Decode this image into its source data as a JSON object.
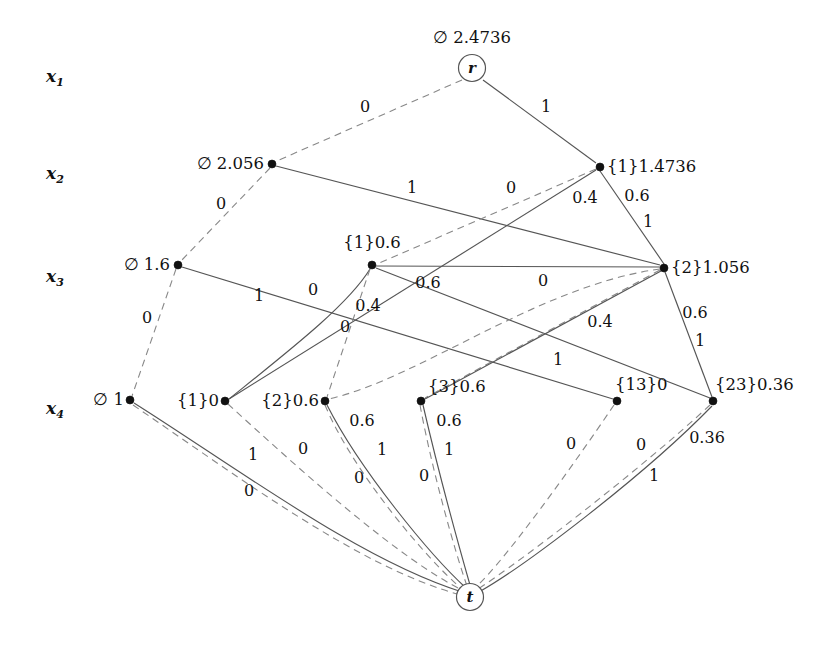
{
  "figure": {
    "background_color": "#ffffff",
    "solid_edge_color": "#555555",
    "dashed_edge_color": "#888888",
    "node_color": "#111111"
  },
  "row_labels": [
    {
      "name": "x1",
      "base": "x",
      "sub": "1",
      "x": 46,
      "y": 68
    },
    {
      "name": "x2",
      "base": "x",
      "sub": "2",
      "x": 46,
      "y": 165
    },
    {
      "name": "x3",
      "base": "x",
      "sub": "3",
      "x": 46,
      "y": 268
    },
    {
      "name": "x4",
      "base": "x",
      "sub": "4",
      "x": 46,
      "y": 400
    }
  ],
  "nodes": [
    {
      "id": "r",
      "label": "r",
      "value_label": "∅ 2.4736",
      "layer": "x1",
      "x": 472,
      "y": 68,
      "shape": "circle",
      "label_pos": "above",
      "label_dx": 0,
      "label_dy": -22
    },
    {
      "id": "n20",
      "label": "",
      "value_label": "∅ 2.056",
      "layer": "x2",
      "x": 272,
      "y": 164,
      "shape": "dot",
      "label_pos": "left",
      "label_dx": -8,
      "label_dy": 0
    },
    {
      "id": "n21",
      "label": "",
      "value_label": "{1}1.4736",
      "layer": "x2",
      "x": 600,
      "y": 167,
      "shape": "dot",
      "label_pos": "right",
      "label_dx": 7,
      "label_dy": 0
    },
    {
      "id": "n30",
      "label": "",
      "value_label": "∅ 1.6",
      "layer": "x3",
      "x": 178,
      "y": 265,
      "shape": "dot",
      "label_pos": "left",
      "label_dx": -8,
      "label_dy": 0
    },
    {
      "id": "n31",
      "label": "",
      "value_label": "{1}0.6",
      "layer": "x3",
      "x": 372,
      "y": 265,
      "shape": "dot",
      "label_pos": "above",
      "label_dx": 0,
      "label_dy": -14
    },
    {
      "id": "n32",
      "label": "",
      "value_label": "{2}1.056",
      "layer": "x3",
      "x": 664,
      "y": 268,
      "shape": "dot",
      "label_pos": "right",
      "label_dx": 7,
      "label_dy": 0
    },
    {
      "id": "n40",
      "label": "",
      "value_label": "∅ 1",
      "layer": "x4",
      "x": 130,
      "y": 400,
      "shape": "dot",
      "label_pos": "left",
      "label_dx": -6,
      "label_dy": 0
    },
    {
      "id": "n41",
      "label": "",
      "value_label": "{1}0",
      "layer": "x4",
      "x": 225,
      "y": 401,
      "shape": "dot",
      "label_pos": "left",
      "label_dx": -6,
      "label_dy": 0
    },
    {
      "id": "n42",
      "label": "",
      "value_label": "{2}0.6",
      "layer": "x4",
      "x": 325,
      "y": 401,
      "shape": "dot",
      "label_pos": "left",
      "label_dx": -6,
      "label_dy": 0
    },
    {
      "id": "n43",
      "label": "",
      "value_label": "{3}0.6",
      "layer": "x4",
      "x": 421,
      "y": 401,
      "shape": "dot",
      "label_pos": "right",
      "label_dx": 7,
      "label_dy": -14
    },
    {
      "id": "n44",
      "label": "",
      "value_label": "{13}0",
      "layer": "x4",
      "x": 617,
      "y": 401,
      "shape": "dot",
      "label_pos": "right",
      "label_dx": -2,
      "label_dy": -16
    },
    {
      "id": "n45",
      "label": "",
      "value_label": "{23}0.36",
      "layer": "x4",
      "x": 713,
      "y": 401,
      "shape": "dot",
      "label_pos": "right",
      "label_dx": 2,
      "label_dy": -16
    },
    {
      "id": "t",
      "label": "t",
      "value_label": "",
      "layer": "t",
      "x": 470,
      "y": 597,
      "shape": "circle",
      "label_pos": "above",
      "label_dx": 0,
      "label_dy": 0
    }
  ],
  "edges": [
    {
      "from": "r",
      "to": "n20",
      "style": "dashed",
      "label": "0",
      "lx": 365,
      "ly": 107
    },
    {
      "from": "r",
      "to": "n21",
      "style": "solid",
      "label": "1",
      "lx": 546,
      "ly": 107
    },
    {
      "from": "n20",
      "to": "n30",
      "style": "dashed",
      "label": "0",
      "lx": 221,
      "ly": 204
    },
    {
      "from": "n20",
      "to": "n32",
      "style": "solid",
      "label": "1",
      "lx": 412,
      "ly": 188
    },
    {
      "from": "n21",
      "to": "n31",
      "style": "dashed",
      "label": "0",
      "lx": 511,
      "ly": 188
    },
    {
      "from": "n21",
      "to": "n41",
      "style": "solid",
      "label": "0.4",
      "lx": 585,
      "ly": 198
    },
    {
      "from": "n21",
      "to": "n32",
      "style": "solid",
      "label": "0.6",
      "lx": 637,
      "ly": 196
    },
    {
      "from": "n21",
      "to": "n32",
      "style": "solid",
      "label": "1",
      "lx": 648,
      "ly": 222
    },
    {
      "from": "n30",
      "to": "n40",
      "style": "dashed",
      "label": "0",
      "lx": 147,
      "ly": 318
    },
    {
      "from": "n30",
      "to": "n44",
      "style": "solid",
      "label": "1",
      "lx": 259,
      "ly": 296
    },
    {
      "from": "n31",
      "to": "n41",
      "style": "solid",
      "label": "0.4",
      "lx": 368,
      "ly": 306
    },
    {
      "from": "n31",
      "to": "n42",
      "style": "dashed",
      "label": "0",
      "lx": 345,
      "ly": 327
    },
    {
      "from": "n31",
      "to": "n32",
      "style": "solid",
      "label": "0.6",
      "lx": 428,
      "ly": 283
    },
    {
      "from": "n31",
      "to": "n45",
      "style": "solid",
      "label": "1",
      "lx": 558,
      "ly": 360
    },
    {
      "from": "n32",
      "to": "n42",
      "style": "dashed",
      "label": "0",
      "lx": 313,
      "ly": 290
    },
    {
      "from": "n32",
      "to": "n43",
      "style": "dashed",
      "label": "0",
      "lx": 543,
      "ly": 281
    },
    {
      "from": "n32",
      "to": "n43",
      "style": "solid",
      "label": "0.4",
      "lx": 600,
      "ly": 322
    },
    {
      "from": "n32",
      "to": "n45",
      "style": "solid",
      "label": "0.6",
      "lx": 695,
      "ly": 313
    },
    {
      "from": "n32",
      "to": "n45",
      "style": "solid",
      "label": "1",
      "lx": 700,
      "ly": 341
    },
    {
      "from": "n40",
      "to": "t",
      "style": "solid",
      "label": "1",
      "lx": 253,
      "ly": 455
    },
    {
      "from": "n40",
      "to": "t",
      "style": "dashed",
      "label": "0",
      "lx": 249,
      "ly": 491
    },
    {
      "from": "n41",
      "to": "t",
      "style": "dashed",
      "label": "0",
      "lx": 303,
      "ly": 449
    },
    {
      "from": "n42",
      "to": "t",
      "style": "solid",
      "label": "0.6",
      "lx": 362,
      "ly": 421
    },
    {
      "from": "n42",
      "to": "t",
      "style": "solid",
      "label": "1",
      "lx": 382,
      "ly": 450
    },
    {
      "from": "n42",
      "to": "t",
      "style": "dashed",
      "label": "0",
      "lx": 359,
      "ly": 478
    },
    {
      "from": "n43",
      "to": "t",
      "style": "solid",
      "label": "0.6",
      "lx": 449,
      "ly": 421
    },
    {
      "from": "n43",
      "to": "t",
      "style": "solid",
      "label": "1",
      "lx": 449,
      "ly": 450
    },
    {
      "from": "n43",
      "to": "t",
      "style": "dashed",
      "label": "0",
      "lx": 424,
      "ly": 476
    },
    {
      "from": "n44",
      "to": "t",
      "style": "dashed",
      "label": "0",
      "lx": 571,
      "ly": 444
    },
    {
      "from": "n45",
      "to": "t",
      "style": "dashed",
      "label": "0",
      "lx": 641,
      "ly": 445
    },
    {
      "from": "n45",
      "to": "t",
      "style": "solid",
      "label": "0.36",
      "lx": 707,
      "ly": 438
    },
    {
      "from": "n45",
      "to": "t",
      "style": "solid",
      "label": "1",
      "lx": 654,
      "ly": 476
    }
  ],
  "edge_paths": [
    {
      "name": "r-to-n20",
      "style": "dashed",
      "d": "M 462 80 L 279 160"
    },
    {
      "name": "r-to-n21",
      "style": "solid",
      "d": "M 483 80 L 596 163"
    },
    {
      "name": "n20-to-n30",
      "style": "dashed",
      "d": "M 270 168 L 181 261"
    },
    {
      "name": "n20-to-n32",
      "style": "solid",
      "d": "M 276 166 L 660 265"
    },
    {
      "name": "n21-to-n31",
      "style": "dashed",
      "d": "M 596 169 L 377 264"
    },
    {
      "name": "n21-to-n41",
      "style": "solid",
      "d": "M 596 170 L 229 399"
    },
    {
      "name": "n21-to-n32",
      "style": "solid",
      "d": "M 600 171 L 664 264"
    },
    {
      "name": "n30-to-n40",
      "style": "dashed",
      "d": "M 176 269 L 132 396"
    },
    {
      "name": "n30-to-n44",
      "style": "solid",
      "d": "M 182 267 L 613 399"
    },
    {
      "name": "n31-curve-n41",
      "style": "solid",
      "d": "M 370 269 C 348 305 290 350 229 399"
    },
    {
      "name": "n31-to-n42",
      "style": "dashed",
      "d": "M 370 269 L 327 397"
    },
    {
      "name": "n31-to-n32",
      "style": "solid",
      "d": "M 376 266 L 660 267"
    },
    {
      "name": "n31-to-n45",
      "style": "solid",
      "d": "M 376 268 L 710 398"
    },
    {
      "name": "n32-to-n42",
      "style": "dashed",
      "d": "M 660 269 C 540 285 420 378 329 399"
    },
    {
      "name": "n32-to-n43",
      "style": "dashed",
      "d": "M 660 270 L 425 398"
    },
    {
      "name": "n32-to-n43",
      "style": "solid",
      "d": "M 661 271 L 425 399"
    },
    {
      "name": "n32-to-n45",
      "style": "solid",
      "d": "M 665 272 L 712 397"
    },
    {
      "name": "n40-to-t",
      "style": "solid",
      "d": "M 134 403 C 240 470 360 560 462 592"
    },
    {
      "name": "n40-to-t",
      "style": "dashed",
      "d": "M 133 405 C 240 478 360 568 461 595"
    },
    {
      "name": "n41-to-t",
      "style": "dashed",
      "d": "M 228 404 C 300 470 400 560 464 591"
    },
    {
      "name": "n42-to-t",
      "style": "solid",
      "d": "M 327 405 C 360 470 430 555 466 588"
    },
    {
      "name": "n42-to-t",
      "style": "dashed",
      "d": "M 325 405 C 352 470 425 558 463 590"
    },
    {
      "name": "n43-to-t",
      "style": "solid",
      "d": "M 423 405 C 438 470 460 550 470 585"
    },
    {
      "name": "n43-to-t",
      "style": "dashed",
      "d": "M 420 405 C 432 470 455 552 467 586"
    },
    {
      "name": "n44-to-t",
      "style": "dashed",
      "d": "M 614 405 C 570 470 505 560 476 587"
    },
    {
      "name": "n45-to-t",
      "style": "dashed",
      "d": "M 710 405 C 640 470 520 562 478 589"
    },
    {
      "name": "n45-to-t",
      "style": "solid",
      "d": "M 712 406 C 645 475 525 566 479 592"
    }
  ],
  "terminals": {
    "root_letter": "r",
    "sink_letter": "t"
  }
}
